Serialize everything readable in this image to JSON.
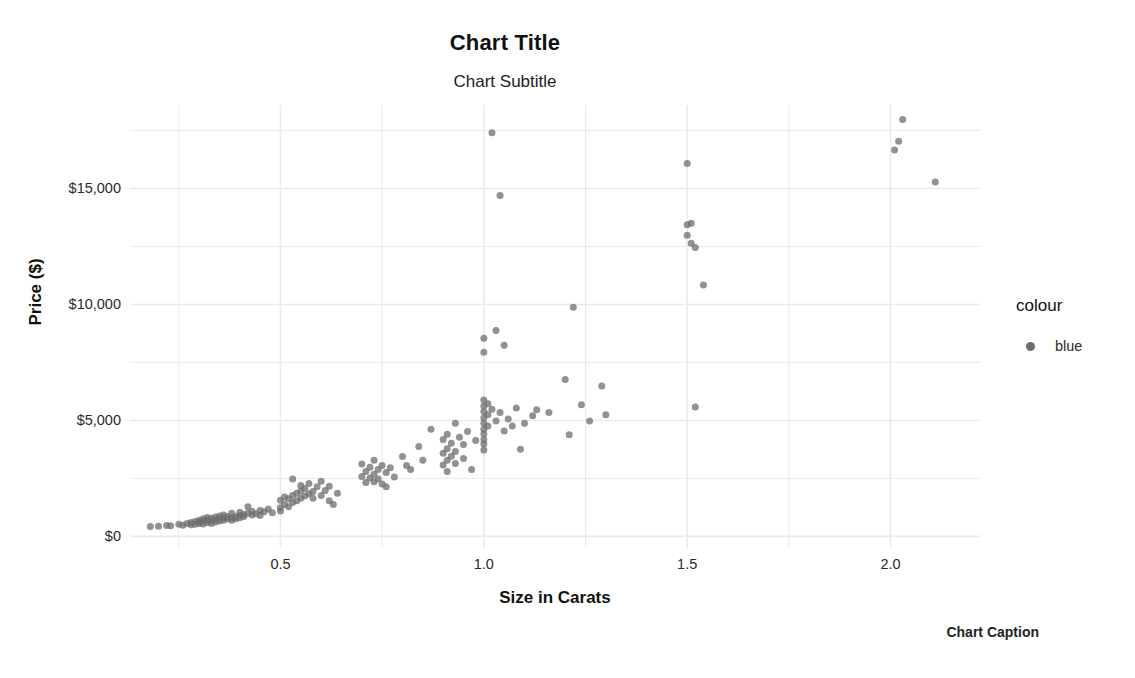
{
  "chart_data": {
    "type": "scatter",
    "title": "Chart Title",
    "subtitle": "Chart Subtitle",
    "caption": "Chart Caption",
    "xlabel": "Size in Carats",
    "ylabel": "Price ($)",
    "xlim": [
      0.13,
      2.22
    ],
    "ylim": [
      -500,
      18600
    ],
    "xticks": [
      0.5,
      1.0,
      1.5,
      2.0
    ],
    "xticklabels": [
      "0.5",
      "1.0",
      "1.5",
      "2.0"
    ],
    "yticks": [
      0,
      5000,
      10000,
      15000
    ],
    "yticklabels": [
      "$0",
      "$5,000",
      "$10,000",
      "$15,000"
    ],
    "grid": true,
    "minor_grid": true,
    "grid_color": "#ebebeb",
    "point_color": "#6e6e6e",
    "point_opacity": 0.75,
    "point_size": 7,
    "background": "#ffffff",
    "legend": {
      "position": "right",
      "title": "colour",
      "entries": [
        {
          "label": "blue",
          "color": "#6e6e6e"
        }
      ]
    },
    "series": [
      {
        "name": "blue",
        "points": [
          [
            0.18,
            430
          ],
          [
            0.2,
            440
          ],
          [
            0.22,
            470
          ],
          [
            0.23,
            455
          ],
          [
            0.25,
            520
          ],
          [
            0.26,
            480
          ],
          [
            0.27,
            560
          ],
          [
            0.28,
            600
          ],
          [
            0.28,
            500
          ],
          [
            0.29,
            640
          ],
          [
            0.29,
            520
          ],
          [
            0.3,
            700
          ],
          [
            0.3,
            560
          ],
          [
            0.3,
            620
          ],
          [
            0.31,
            660
          ],
          [
            0.31,
            540
          ],
          [
            0.31,
            760
          ],
          [
            0.32,
            700
          ],
          [
            0.32,
            600
          ],
          [
            0.32,
            820
          ],
          [
            0.33,
            680
          ],
          [
            0.33,
            780
          ],
          [
            0.33,
            560
          ],
          [
            0.34,
            720
          ],
          [
            0.34,
            840
          ],
          [
            0.34,
            620
          ],
          [
            0.35,
            760
          ],
          [
            0.35,
            880
          ],
          [
            0.35,
            660
          ],
          [
            0.36,
            800
          ],
          [
            0.36,
            700
          ],
          [
            0.36,
            920
          ],
          [
            0.37,
            760
          ],
          [
            0.37,
            860
          ],
          [
            0.38,
            800
          ],
          [
            0.38,
            1000
          ],
          [
            0.38,
            700
          ],
          [
            0.39,
            860
          ],
          [
            0.39,
            760
          ],
          [
            0.4,
            900
          ],
          [
            0.4,
            1040
          ],
          [
            0.4,
            800
          ],
          [
            0.41,
            940
          ],
          [
            0.41,
            860
          ],
          [
            0.42,
            1000
          ],
          [
            0.42,
            1280
          ],
          [
            0.43,
            920
          ],
          [
            0.43,
            1080
          ],
          [
            0.44,
            980
          ],
          [
            0.45,
            1120
          ],
          [
            0.45,
            900
          ],
          [
            0.46,
            1060
          ],
          [
            0.47,
            1180
          ],
          [
            0.48,
            1020
          ],
          [
            0.5,
            1240
          ],
          [
            0.5,
            1560
          ],
          [
            0.5,
            1100
          ],
          [
            0.51,
            1700
          ],
          [
            0.51,
            1380
          ],
          [
            0.52,
            1620
          ],
          [
            0.52,
            1280
          ],
          [
            0.53,
            1760
          ],
          [
            0.53,
            1460
          ],
          [
            0.53,
            2480
          ],
          [
            0.54,
            1860
          ],
          [
            0.54,
            1540
          ],
          [
            0.55,
            1960
          ],
          [
            0.55,
            1640
          ],
          [
            0.55,
            2200
          ],
          [
            0.56,
            1740
          ],
          [
            0.56,
            2060
          ],
          [
            0.57,
            1840
          ],
          [
            0.57,
            2280
          ],
          [
            0.58,
            1940
          ],
          [
            0.58,
            1640
          ],
          [
            0.59,
            2140
          ],
          [
            0.6,
            1760
          ],
          [
            0.6,
            2380
          ],
          [
            0.61,
            1980
          ],
          [
            0.62,
            1540
          ],
          [
            0.62,
            2160
          ],
          [
            0.63,
            1380
          ],
          [
            0.64,
            1860
          ],
          [
            0.7,
            3120
          ],
          [
            0.7,
            2580
          ],
          [
            0.71,
            2800
          ],
          [
            0.71,
            2320
          ],
          [
            0.72,
            2980
          ],
          [
            0.72,
            2520
          ],
          [
            0.73,
            3280
          ],
          [
            0.73,
            2680
          ],
          [
            0.73,
            2360
          ],
          [
            0.74,
            2880
          ],
          [
            0.74,
            2480
          ],
          [
            0.75,
            3060
          ],
          [
            0.75,
            2260
          ],
          [
            0.76,
            2760
          ],
          [
            0.76,
            2140
          ],
          [
            0.77,
            2960
          ],
          [
            0.78,
            2560
          ],
          [
            0.8,
            3440
          ],
          [
            0.81,
            3060
          ],
          [
            0.82,
            2880
          ],
          [
            0.84,
            3880
          ],
          [
            0.85,
            3280
          ],
          [
            0.87,
            4620
          ],
          [
            0.9,
            4180
          ],
          [
            0.9,
            3580
          ],
          [
            0.9,
            3080
          ],
          [
            0.91,
            4400
          ],
          [
            0.91,
            3780
          ],
          [
            0.91,
            3280
          ],
          [
            0.91,
            2800
          ],
          [
            0.92,
            4020
          ],
          [
            0.92,
            3460
          ],
          [
            0.93,
            4880
          ],
          [
            0.93,
            3660
          ],
          [
            0.93,
            3140
          ],
          [
            0.94,
            4280
          ],
          [
            0.95,
            3960
          ],
          [
            0.95,
            3360
          ],
          [
            0.96,
            4520
          ],
          [
            0.97,
            2880
          ],
          [
            0.98,
            4140
          ],
          [
            1.0,
            5880
          ],
          [
            1.0,
            5380
          ],
          [
            1.0,
            4880
          ],
          [
            1.0,
            4420
          ],
          [
            1.0,
            3980
          ],
          [
            1.0,
            5620
          ],
          [
            1.0,
            5120
          ],
          [
            1.0,
            4620
          ],
          [
            1.0,
            4180
          ],
          [
            1.0,
            7940
          ],
          [
            1.0,
            8540
          ],
          [
            1.0,
            3720
          ],
          [
            1.01,
            5720
          ],
          [
            1.01,
            5240
          ],
          [
            1.01,
            4760
          ],
          [
            1.02,
            5480
          ],
          [
            1.02,
            17400
          ],
          [
            1.03,
            4980
          ],
          [
            1.03,
            8880
          ],
          [
            1.04,
            5340
          ],
          [
            1.04,
            14700
          ],
          [
            1.05,
            4540
          ],
          [
            1.05,
            8240
          ],
          [
            1.06,
            5060
          ],
          [
            1.07,
            4760
          ],
          [
            1.08,
            5540
          ],
          [
            1.09,
            3760
          ],
          [
            1.1,
            4880
          ],
          [
            1.12,
            5200
          ],
          [
            1.13,
            5460
          ],
          [
            1.16,
            5340
          ],
          [
            1.2,
            6760
          ],
          [
            1.21,
            4380
          ],
          [
            1.22,
            9880
          ],
          [
            1.24,
            5680
          ],
          [
            1.26,
            4980
          ],
          [
            1.29,
            6480
          ],
          [
            1.3,
            5240
          ],
          [
            1.5,
            13440
          ],
          [
            1.5,
            12980
          ],
          [
            1.5,
            16080
          ],
          [
            1.51,
            13500
          ],
          [
            1.51,
            12640
          ],
          [
            1.52,
            12460
          ],
          [
            1.52,
            5580
          ],
          [
            1.54,
            10840
          ],
          [
            2.01,
            16660
          ],
          [
            2.02,
            17040
          ],
          [
            2.03,
            17980
          ],
          [
            2.11,
            15280
          ]
        ]
      }
    ]
  }
}
